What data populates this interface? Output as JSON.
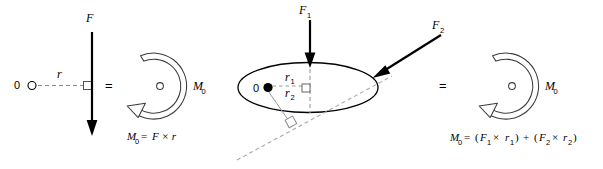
{
  "figure": {
    "background_color": "#ffffff",
    "stroke_color": "#000000",
    "dashed_color": "#999999"
  },
  "left_panel": {
    "origin_label": "0",
    "origin_marker": "open-circle",
    "distance_label": "r",
    "force_label": "F",
    "force_direction": "down",
    "perpendicular_marker": "square",
    "equals_sign": "=",
    "moment_label": "M",
    "moment_subscript": "0",
    "moment_direction": "counterclockwise",
    "formula": {
      "lhs": "M",
      "lhs_sub": "0",
      "eq": "=",
      "rhs": "F × r"
    }
  },
  "middle_panel": {
    "origin_label": "0",
    "origin_marker": "filled-dot",
    "body_shape": "ellipse",
    "force1_label": "F",
    "force1_subscript": "1",
    "force1_direction": "down",
    "force2_label": "F",
    "force2_subscript": "2",
    "force2_direction": "down-left",
    "radius1_label": "r",
    "radius1_subscript": "1",
    "radius2_label": "r",
    "radius2_subscript": "2",
    "perpendicular_marker_1": "square",
    "perpendicular_marker_2": "square"
  },
  "right_panel": {
    "equals_sign": "=",
    "moment_label": "M",
    "moment_subscript": "0",
    "moment_direction": "counterclockwise",
    "formula": {
      "lhs": "M",
      "lhs_sub": "0",
      "eq": "=",
      "term1_open": "(",
      "term1_f": "F",
      "term1_f_sub": "1",
      "term1_times": "×",
      "term1_r": "r",
      "term1_r_sub": "1",
      "term1_close": ")",
      "plus": "+",
      "term2_open": "(",
      "term2_f": "F",
      "term2_f_sub": "2",
      "term2_times": "×",
      "term2_r": "r",
      "term2_r_sub": "2",
      "term2_close": ")"
    }
  }
}
